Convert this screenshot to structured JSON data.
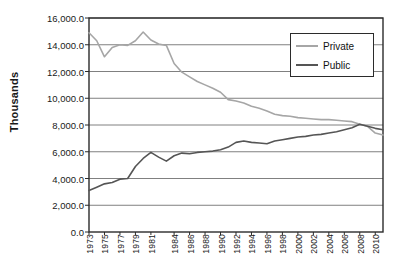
{
  "chart_data": {
    "type": "line",
    "title": "",
    "xlabel": "",
    "ylabel": "Thousands",
    "ylim": [
      0,
      16000
    ],
    "ytick_step": 2000,
    "ytick_labels": [
      "16,000.0",
      "14,000.0",
      "12,000.0",
      "10,000.0",
      "8,000.0",
      "6,000.0",
      "4,000.0",
      "2,000.0",
      "0.0"
    ],
    "ytick_values": [
      16000,
      14000,
      12000,
      10000,
      8000,
      6000,
      4000,
      2000,
      0
    ],
    "xlim": [
      1973,
      2011
    ],
    "xtick_labels": [
      "1973",
      "1975",
      "1977",
      "1979",
      "1981",
      "1984",
      "1986",
      "1988",
      "1990",
      "1992",
      "1994",
      "1996",
      "1998",
      "2000",
      "2002",
      "2004",
      "2006",
      "2008",
      "2010"
    ],
    "xtick_values": [
      1973,
      1975,
      1977,
      1979,
      1981,
      1984,
      1986,
      1988,
      1990,
      1992,
      1994,
      1996,
      1998,
      2000,
      2002,
      2004,
      2006,
      2008,
      2010
    ],
    "grid": "horizontal",
    "legend_position": "top-right",
    "x": [
      1973,
      1974,
      1975,
      1976,
      1977,
      1978,
      1979,
      1980,
      1981,
      1982,
      1983,
      1984,
      1985,
      1986,
      1987,
      1988,
      1989,
      1990,
      1991,
      1992,
      1993,
      1994,
      1995,
      1996,
      1997,
      1998,
      1999,
      2000,
      2001,
      2002,
      2003,
      2004,
      2005,
      2006,
      2007,
      2008,
      2009,
      2010,
      2011
    ],
    "series": [
      {
        "name": "Private",
        "color": "#a6a6a6",
        "values": [
          14900,
          14300,
          13100,
          13800,
          14000,
          13950,
          14300,
          14950,
          14350,
          14050,
          13950,
          12600,
          11950,
          11600,
          11250,
          11000,
          10750,
          10450,
          9900,
          9800,
          9650,
          9400,
          9250,
          9050,
          8800,
          8700,
          8650,
          8550,
          8500,
          8450,
          8400,
          8400,
          8350,
          8300,
          8250,
          8050,
          7900,
          7400,
          7250
        ]
      },
      {
        "name": "Public",
        "color": "#555555",
        "values": [
          3100,
          3350,
          3600,
          3700,
          3950,
          4000,
          4900,
          5500,
          5950,
          5600,
          5300,
          5700,
          5900,
          5850,
          5950,
          6000,
          6050,
          6150,
          6350,
          6700,
          6800,
          6700,
          6650,
          6600,
          6800,
          6900,
          7000,
          7100,
          7150,
          7250,
          7300,
          7400,
          7500,
          7650,
          7800,
          8050,
          7900,
          7750,
          7650
        ]
      }
    ]
  },
  "legend": {
    "items": [
      {
        "label": "Private"
      },
      {
        "label": "Public"
      }
    ]
  }
}
